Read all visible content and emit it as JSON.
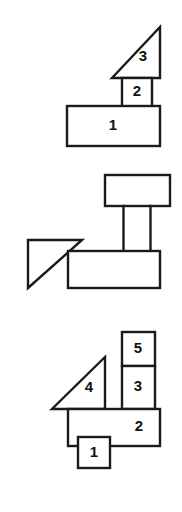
{
  "sheet": {
    "title": "Block Assembly Figures",
    "background_color": "#ffffff",
    "stroke_color": "#1a1a1a",
    "label_color": "#111111",
    "width": 182,
    "height": 512
  },
  "figures": [
    {
      "id": "figure-top",
      "name": "figure-1",
      "part_count": 3,
      "parts": [
        {
          "label": "1",
          "shape": "rectangle",
          "role": "base-bar",
          "label_x": 113,
          "label_y": 126
        },
        {
          "label": "2",
          "shape": "rectangle",
          "role": "vertical-column",
          "label_x": 137,
          "label_y": 92
        },
        {
          "label": "3",
          "shape": "right-triangle",
          "role": "triangle-top-right-angle",
          "label_x": 143,
          "label_y": 57
        }
      ]
    },
    {
      "id": "figure-middle",
      "name": "figure-2",
      "part_count": 4,
      "parts": [
        {
          "label": "",
          "shape": "rectangle",
          "role": "top-bar",
          "label_x": 0,
          "label_y": 0
        },
        {
          "label": "",
          "shape": "rectangle",
          "role": "vertical-column",
          "label_x": 0,
          "label_y": 0
        },
        {
          "label": "",
          "shape": "rectangle",
          "role": "base-bar",
          "label_x": 0,
          "label_y": 0
        },
        {
          "label": "",
          "shape": "right-triangle",
          "role": "triangle-left-right-angle",
          "label_x": 0,
          "label_y": 0
        }
      ]
    },
    {
      "id": "figure-bottom",
      "name": "figure-3",
      "part_count": 5,
      "parts": [
        {
          "label": "1",
          "shape": "rectangle",
          "role": "small-square-foot",
          "label_x": 94,
          "label_y": 453
        },
        {
          "label": "2",
          "shape": "rectangle",
          "role": "base-bar",
          "label_x": 139,
          "label_y": 427
        },
        {
          "label": "3",
          "shape": "rectangle",
          "role": "stacked-box-lower",
          "label_x": 138,
          "label_y": 387
        },
        {
          "label": "4",
          "shape": "right-triangle",
          "role": "triangle-bottom-right-angle",
          "label_x": 89,
          "label_y": 388
        },
        {
          "label": "5",
          "shape": "rectangle",
          "role": "stacked-box-upper",
          "label_x": 138,
          "label_y": 349
        }
      ]
    }
  ]
}
